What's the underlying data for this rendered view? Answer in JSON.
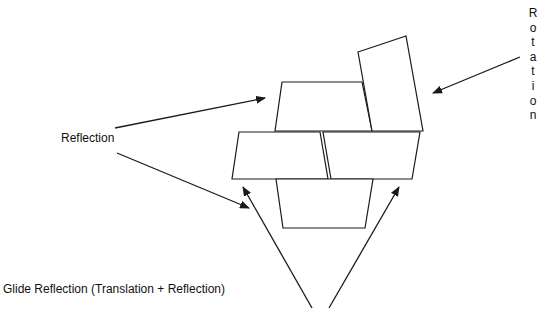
{
  "labels": {
    "reflection": "Reflection",
    "glide_reflection": "Glide Reflection (Translation + Reflection)",
    "rotation": "Rotation",
    "rotation_letters": [
      "R",
      "o",
      "t",
      "a",
      "t",
      "i",
      "o",
      "n"
    ]
  },
  "colors": {
    "stroke": "#1a1a1a",
    "background": "#ffffff",
    "text": "#111111"
  },
  "shapes": {
    "top_trapezoid": "282,82 362,82 372,131 275,131",
    "rotated_rectangle": "358,52 406,36 423,131 372,131",
    "middle_left": "239,132 320,132 328,179 232,179",
    "middle_right": "323,132 420,132 412,179 331,179",
    "bottom_trapezoid": "276,179 373,179 365,228 283,228"
  },
  "arrows": [
    {
      "name": "reflection-arrow-upper",
      "x1": 115,
      "y1": 128,
      "x2": 265,
      "y2": 98
    },
    {
      "name": "reflection-arrow-lower",
      "x1": 117,
      "y1": 153,
      "x2": 249,
      "y2": 208
    },
    {
      "name": "glide-arrow-left",
      "x1": 312,
      "y1": 308,
      "x2": 243,
      "y2": 187
    },
    {
      "name": "glide-arrow-right",
      "x1": 329,
      "y1": 308,
      "x2": 399,
      "y2": 187
    },
    {
      "name": "rotation-arrow",
      "x1": 520,
      "y1": 57,
      "x2": 433,
      "y2": 93
    }
  ]
}
